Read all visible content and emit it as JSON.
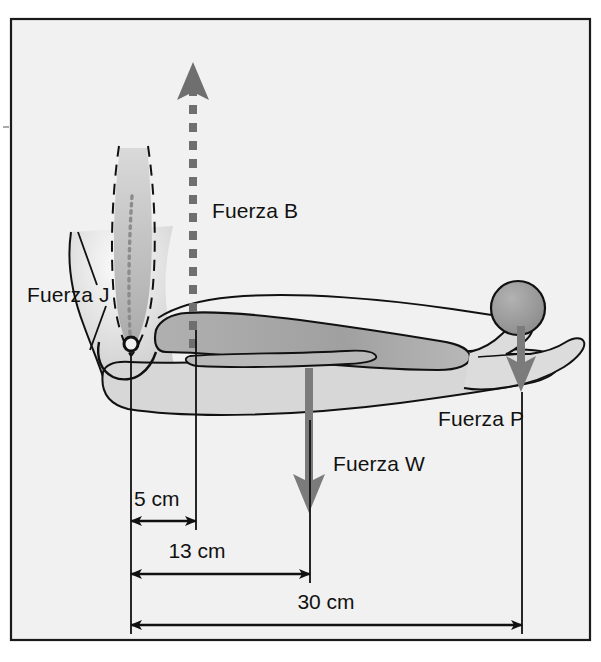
{
  "figure": {
    "type": "biomechanics-free-body-diagram",
    "language": "es",
    "frame": {
      "border_color": "#1a1a1a",
      "background_color": "#f2f2f2",
      "page_color": "#ffffff"
    },
    "colors": {
      "outline": "#111111",
      "force_arrow_gray": "#7a7a7a",
      "ball_fill": "#9a9a9a",
      "bone_fill": "#a8a8a8",
      "muscle_fill": "#b4b4b4",
      "soft_tissue_fill": "#d2d2d2",
      "dimension_black": "#111111"
    }
  },
  "forces": [
    {
      "id": "force-b",
      "label": "Fuerza B",
      "symbol": "B",
      "meaning": "Fuerza del biceps",
      "direction": "up",
      "style": "dashed",
      "color": "#7a7a7a",
      "label_x": 212,
      "label_y": 218,
      "line_x": 193,
      "tip_y": 64,
      "tail_y": 345
    },
    {
      "id": "force-j",
      "label": "Fuerza J",
      "symbol": "J",
      "meaning": "Fuerza de la articulacion",
      "direction": "leader-line",
      "style": "leader",
      "color": "#111111",
      "label_x": 27,
      "label_y": 302,
      "leader_from_x": 112,
      "leader_from_y": 288,
      "leader_to_x": 75,
      "leader_to_y": 233
    },
    {
      "id": "force-w",
      "label": "Fuerza W",
      "symbol": "W",
      "meaning": "Peso del antebrazo",
      "direction": "down",
      "style": "solid",
      "color": "#7a7a7a",
      "label_x": 333,
      "label_y": 471,
      "line_x": 309,
      "tail_y": 372,
      "tip_y": 512
    },
    {
      "id": "force-p",
      "label": "Fuerza P",
      "symbol": "P",
      "meaning": "Peso de la pelota",
      "direction": "down",
      "style": "solid",
      "color": "#7a7a7a",
      "label_x": 438,
      "label_y": 426,
      "line_x": 522,
      "tail_y": 330,
      "tip_y": 391
    }
  ],
  "dimensions": [
    {
      "id": "dim-5cm",
      "label": "5 cm",
      "value": 5,
      "unit": "cm",
      "from": "codo (articulacion)",
      "to": "insercion del biceps",
      "label_x": 134,
      "label_y": 506,
      "line_y": 521,
      "x1": 131,
      "x2": 197
    },
    {
      "id": "dim-13cm",
      "label": "13 cm",
      "value": 13,
      "unit": "cm",
      "from": "codo (articulacion)",
      "to": "centro de masa del antebrazo",
      "label_x": 197,
      "label_y": 558,
      "line_y": 574,
      "x1": 131,
      "x2": 310
    },
    {
      "id": "dim-30cm",
      "label": "30 cm",
      "value": 30,
      "unit": "cm",
      "from": "codo (articulacion)",
      "to": "pelota en la mano",
      "label_x": 288,
      "label_y": 609,
      "line_y": 625,
      "x1": 131,
      "x2": 522
    }
  ],
  "anatomy": {
    "ball": {
      "name": "pelota",
      "cx": 518,
      "cy": 308,
      "r": 27
    },
    "joint": {
      "name": "articulacion-del-codo",
      "cx": 131,
      "cy": 344,
      "r": 7
    },
    "humerus": {
      "name": "humero",
      "style": "dashed-outline"
    },
    "radius_ulna": {
      "name": "radio-y-cubito",
      "style": "solid-fill"
    },
    "biceps": {
      "name": "biceps",
      "style": "shaded"
    },
    "hand": {
      "name": "mano",
      "style": "outline"
    }
  }
}
